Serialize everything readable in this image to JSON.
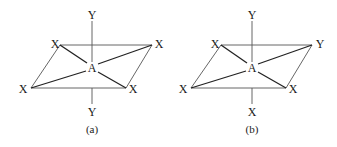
{
  "diagrams": [
    {
      "caption": "(a)",
      "center": "A",
      "top": "Y",
      "bottom": "Y",
      "top_left": "X",
      "top_right": "X",
      "bottom_left": "X",
      "bottom_right": "X"
    },
    {
      "caption": "(b)",
      "center": "A",
      "top": "Y",
      "bottom": "X",
      "top_left": "X",
      "top_right": "Y",
      "bottom_left": "X",
      "bottom_right": "X"
    }
  ]
}
